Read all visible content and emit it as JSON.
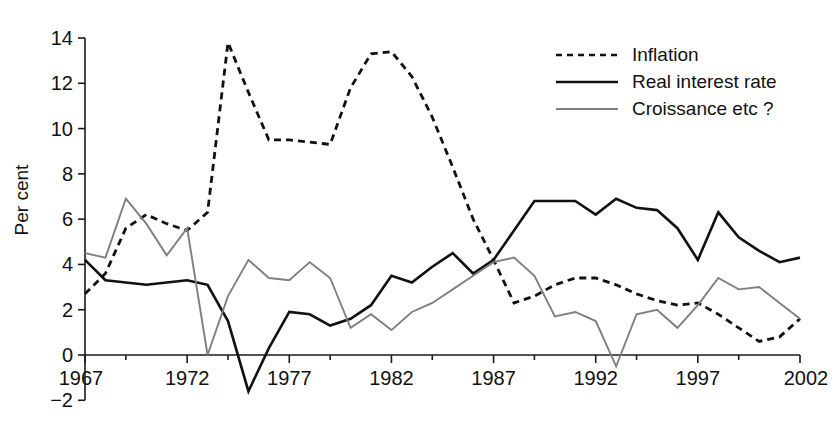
{
  "chart_data": {
    "type": "line",
    "title": "",
    "xlabel": "",
    "ylabel": "Per cent",
    "xlim": [
      1967,
      2002
    ],
    "ylim": [
      -2,
      14
    ],
    "xticks": [
      1967,
      1972,
      1977,
      1982,
      1987,
      1992,
      1997,
      2002
    ],
    "yticks": [
      -2,
      0,
      2,
      4,
      6,
      8,
      10,
      12,
      14
    ],
    "xtick_labels": [
      "1967",
      "1972",
      "1977",
      "1982",
      "1987",
      "1992",
      "1997",
      "2002"
    ],
    "ytick_labels": [
      "-2",
      "0",
      "2",
      "4",
      "6",
      "8",
      "10",
      "12",
      "14"
    ],
    "minor_xticks": [
      1969,
      1974,
      1979,
      1984,
      1989,
      1994,
      1999
    ],
    "grid": false,
    "legend_position": "top-right",
    "x": [
      1967,
      1968,
      1969,
      1970,
      1971,
      1972,
      1973,
      1974,
      1975,
      1976,
      1977,
      1978,
      1979,
      1980,
      1981,
      1982,
      1983,
      1984,
      1985,
      1986,
      1987,
      1988,
      1989,
      1990,
      1991,
      1992,
      1993,
      1994,
      1995,
      1996,
      1997,
      1998,
      1999,
      2000,
      2001,
      2002
    ],
    "series": [
      {
        "name": "Inflation",
        "style": "dashed",
        "color": "#111111",
        "values": [
          2.7,
          3.6,
          5.6,
          6.2,
          5.8,
          5.5,
          6.3,
          13.8,
          11.6,
          9.5,
          9.5,
          9.4,
          9.3,
          11.8,
          13.3,
          13.4,
          12.3,
          10.5,
          8.3,
          6.0,
          4.2,
          2.3,
          2.6,
          3.1,
          3.4,
          3.4,
          3.1,
          2.7,
          2.4,
          2.2,
          2.3,
          1.8,
          1.2,
          0.6,
          0.8,
          1.6
        ]
      },
      {
        "name": "Real interest rate",
        "style": "solid",
        "color": "#111111",
        "values": [
          4.2,
          3.3,
          3.2,
          3.1,
          3.2,
          3.3,
          3.1,
          1.5,
          -1.6,
          0.3,
          1.9,
          1.8,
          1.3,
          1.6,
          2.2,
          3.5,
          3.2,
          3.9,
          4.5,
          3.6,
          4.2,
          5.5,
          6.8,
          6.8,
          6.8,
          6.2,
          6.9,
          6.5,
          6.4,
          5.6,
          4.2,
          6.3,
          5.2,
          4.6,
          4.1,
          4.3
        ]
      },
      {
        "name": "Croissance etc ?",
        "style": "solid",
        "color": "#7f7f7f",
        "values": [
          4.5,
          4.3,
          6.9,
          5.8,
          4.4,
          5.6,
          0.0,
          2.6,
          4.2,
          3.4,
          3.3,
          4.1,
          3.4,
          1.2,
          1.8,
          1.1,
          1.9,
          2.3,
          2.9,
          3.5,
          4.1,
          4.3,
          3.5,
          1.7,
          1.9,
          1.5,
          -0.5,
          1.8,
          2.0,
          1.2,
          2.2,
          3.4,
          2.9,
          3.0,
          2.3,
          1.6
        ]
      }
    ]
  },
  "legend": {
    "items": [
      {
        "label": "Inflation",
        "style": "dashed",
        "color": "#111111"
      },
      {
        "label": "Real interest rate",
        "style": "solid",
        "color": "#111111"
      },
      {
        "label": "Croissance etc ?",
        "style": "solid",
        "color": "#7f7f7f"
      }
    ]
  },
  "axis": {
    "y_title": "Per cent"
  }
}
